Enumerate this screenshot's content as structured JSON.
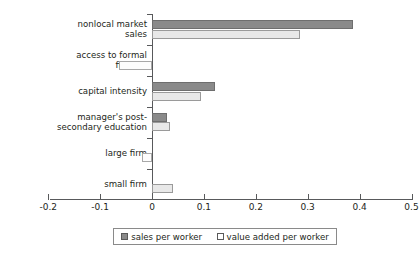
{
  "title_remnant": "",
  "chart_data": {
    "type": "bar",
    "orientation": "horizontal",
    "title": "",
    "xlabel": "",
    "ylabel": "",
    "xlim": [
      -0.2,
      0.5
    ],
    "xticks": [
      -0.2,
      -0.1,
      0,
      0.1,
      0.2,
      0.3,
      0.4,
      0.5
    ],
    "xtick_labels": [
      "-0.2",
      "-0.1",
      "0",
      "0.1",
      "0.2",
      "0.3",
      "0.4",
      "0.5"
    ],
    "grid": false,
    "legend_position": "bottom-center",
    "categories": [
      "nonlocal market\nsales",
      "access to formal\nfinance",
      "capital intensity",
      "manager's post-\nsecondary education",
      "large firm",
      "small firm"
    ],
    "series": [
      {
        "name": "sales per worker",
        "color": "#8a8a8a",
        "values": [
          0.387,
          null,
          0.121,
          0.028,
          null,
          null
        ]
      },
      {
        "name": "value added per worker",
        "color": "#ffffff",
        "values": [
          0.285,
          -0.064,
          0.094,
          0.035,
          -0.02,
          0.04
        ]
      }
    ]
  },
  "legend": {
    "entries": [
      {
        "label": "sales per worker",
        "swatch": "sales"
      },
      {
        "label": "value added per worker",
        "swatch": "value"
      }
    ]
  },
  "colors": {
    "sales_bar": "#8a8a8a",
    "value_bar": "#e8e8e8",
    "axis": "#58595b",
    "text": "#231f20"
  }
}
